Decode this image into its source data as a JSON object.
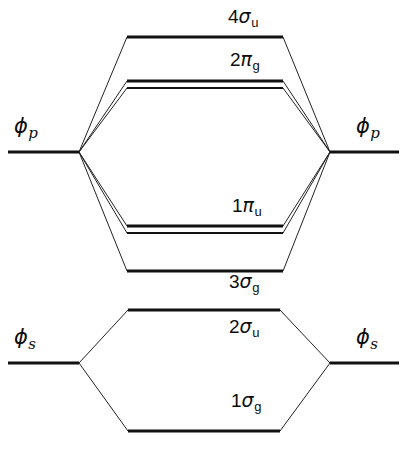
{
  "figure": {
    "type": "molecular-orbital-energy-level-diagram",
    "title": "",
    "background_color": "#ffffff",
    "line_color": "#111111",
    "correlation_line_color": "#222222"
  },
  "atomic_orbitals": [
    {
      "id": "phi-p-left",
      "side": "left",
      "symbol": "ϕ",
      "subscript": "p",
      "label_text": "ϕp",
      "y": 152,
      "x_start": 8,
      "x_end": 79,
      "label_x": 14,
      "label_y": 116
    },
    {
      "id": "phi-p-right",
      "side": "right",
      "symbol": "ϕ",
      "subscript": "p",
      "label_text": "ϕp",
      "y": 152,
      "x_start": 330,
      "x_end": 399,
      "label_x": 356,
      "label_y": 116
    },
    {
      "id": "phi-s-left",
      "side": "left",
      "symbol": "ϕ",
      "subscript": "s",
      "label_text": "ϕs",
      "y": 363,
      "x_start": 8,
      "x_end": 79,
      "label_x": 14,
      "label_y": 327
    },
    {
      "id": "phi-s-right",
      "side": "right",
      "symbol": "ϕ",
      "subscript": "s",
      "label_text": "ϕs",
      "y": 363,
      "x_start": 330,
      "x_end": 399,
      "label_x": 356,
      "label_y": 327
    }
  ],
  "molecular_orbitals": [
    {
      "id": "4sigma-u",
      "number": "4",
      "symbol": "σ",
      "subscript": "u",
      "label_text": "4σu",
      "degenerate": false,
      "y": 37,
      "x_start": 127,
      "x_end": 283,
      "label_x": 228,
      "label_y": 7,
      "label_align": "left",
      "character": "antibonding"
    },
    {
      "id": "2pi-g",
      "number": "2",
      "symbol": "π",
      "subscript": "g",
      "label_text": "2πg",
      "degenerate": true,
      "y": 81,
      "y2": 88,
      "x_start": 127,
      "x_end": 283,
      "label_x": 228,
      "label_y": 50,
      "label_align": "left",
      "character": "antibonding"
    },
    {
      "id": "1pi-u",
      "number": "1",
      "symbol": "π",
      "subscript": "u",
      "label_text": "1πu",
      "degenerate": true,
      "y": 226,
      "y2": 233,
      "x_start": 127,
      "x_end": 283,
      "label_x": 228,
      "label_y": 196,
      "label_align": "left",
      "character": "bonding"
    },
    {
      "id": "3sigma-g",
      "number": "3",
      "symbol": "σ",
      "subscript": "g",
      "label_text": "3σg",
      "degenerate": false,
      "y": 271,
      "x_start": 127,
      "x_end": 283,
      "label_x": 228,
      "label_y": 272,
      "label_align": "left",
      "character": "bonding"
    },
    {
      "id": "2sigma-u",
      "number": "2",
      "symbol": "σ",
      "subscript": "u",
      "label_text": "2σu",
      "degenerate": false,
      "y": 310,
      "x_start": 128,
      "x_end": 280,
      "label_x": 228,
      "label_y": 317,
      "label_align": "left",
      "character": "antibonding"
    },
    {
      "id": "1sigma-g",
      "number": "1",
      "symbol": "σ",
      "subscript": "g",
      "label_text": "1σg",
      "degenerate": false,
      "y": 431,
      "x_start": 128,
      "x_end": 280,
      "label_x": 228,
      "label_y": 391,
      "label_align": "left",
      "character": "bonding"
    }
  ],
  "correlation_lines": {
    "p_left_vertex": {
      "x": 79,
      "y": 152
    },
    "p_right_vertex": {
      "x": 330,
      "y": 152
    },
    "s_left_vertex": {
      "x": 79,
      "y": 363
    },
    "s_right_vertex": {
      "x": 330,
      "y": 363
    },
    "p_targets_left": [
      {
        "to": "4sigma-u",
        "x": 127,
        "y": 37
      },
      {
        "to": "2pi-g",
        "x": 127,
        "y": 81
      },
      {
        "to": "2pi-g-2",
        "x": 127,
        "y": 88
      },
      {
        "to": "1pi-u",
        "x": 127,
        "y": 226
      },
      {
        "to": "1pi-u-2",
        "x": 127,
        "y": 233
      },
      {
        "to": "3sigma-g",
        "x": 127,
        "y": 271
      }
    ],
    "p_targets_right": [
      {
        "to": "4sigma-u",
        "x": 283,
        "y": 37
      },
      {
        "to": "2pi-g",
        "x": 283,
        "y": 81
      },
      {
        "to": "2pi-g-2",
        "x": 283,
        "y": 88
      },
      {
        "to": "1pi-u",
        "x": 283,
        "y": 226
      },
      {
        "to": "1pi-u-2",
        "x": 283,
        "y": 233
      },
      {
        "to": "3sigma-g",
        "x": 283,
        "y": 271
      }
    ],
    "s_targets_left": [
      {
        "to": "2sigma-u",
        "x": 128,
        "y": 310
      },
      {
        "to": "1sigma-g",
        "x": 128,
        "y": 431
      }
    ],
    "s_targets_right": [
      {
        "to": "2sigma-u",
        "x": 280,
        "y": 310
      },
      {
        "to": "1sigma-g",
        "x": 280,
        "y": 431
      }
    ]
  }
}
